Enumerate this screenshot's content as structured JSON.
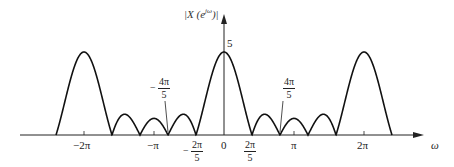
{
  "chart_data": {
    "type": "line",
    "title": "",
    "function": "|X(e^{jω})| = |sin(5ω/2) / sin(ω/2)|",
    "xlabel": "ω",
    "ylabel": "|X(e^{jω})|",
    "y_tick_labels": [
      "5"
    ],
    "peak_value": 5,
    "x_tick_labels_below": [
      "−2π",
      "−π",
      "0",
      "π",
      "2π"
    ],
    "x_fraction_labels_below": [
      {
        "sign": "−",
        "num": "2π",
        "den": "5"
      },
      {
        "sign": "",
        "num": "2π",
        "den": "5"
      }
    ],
    "x_fraction_annotations_above": [
      {
        "sign": "−",
        "num": "4π",
        "den": "5"
      },
      {
        "sign": "",
        "num": "4π",
        "den": "5"
      }
    ],
    "x_range_rad": [
      -2.4,
      2.4
    ],
    "zeros_multiples_of_pi": [
      -2.4,
      -1.6,
      -1.2,
      -0.8,
      -0.4,
      0.4,
      0.8,
      1.2,
      1.6,
      2.4
    ],
    "main_lobe_centers_multiples_of_pi": [
      -2,
      0,
      2
    ],
    "grid": false,
    "legend": null
  },
  "labels": {
    "ylabel": "|X (e",
    "ylabel_sup": "jω",
    "ylabel_close": ")|",
    "five": "5",
    "omega": "ω",
    "m2pi": "−2π",
    "mpi": "−π",
    "zero": "0",
    "pi": "π",
    "p2pi": "2π",
    "frac_m2pi5_sign": "−",
    "frac_2pi5_num": "2π",
    "frac_5_den": "5",
    "frac_4pi_num": "4π"
  }
}
